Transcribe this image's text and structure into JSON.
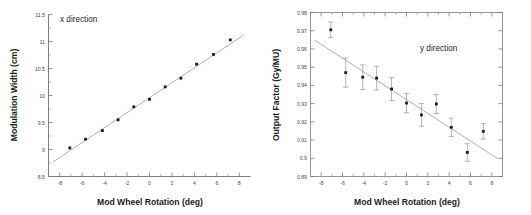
{
  "figure": {
    "panels": [
      "x direction panel",
      "y direction panel"
    ]
  },
  "chart_data": [
    {
      "type": "scatter",
      "panel_id": "x-direction",
      "title": "",
      "annotation": "x direction",
      "xlabel": "Mod Wheel Rotation (deg)",
      "ylabel": "Modulation Width (cm)",
      "xlim": [
        -9,
        9
      ],
      "ylim": [
        8.5,
        11.5
      ],
      "xticks": [
        -8,
        -6,
        -4,
        -2,
        0,
        2,
        4,
        6,
        8
      ],
      "xticklabels": [
        "-8",
        "-6",
        "-4",
        "-2",
        "0",
        "2",
        "4",
        "6",
        "8"
      ],
      "yticks": [
        8.5,
        9,
        9.5,
        10,
        10.5,
        11,
        11.5
      ],
      "yticklabels": [
        "8.5",
        "9",
        "9.5",
        "10",
        "10.5",
        "11",
        "11.5"
      ],
      "grid": false,
      "legend": null,
      "series": [
        {
          "name": "Modulation width measurements",
          "marker": "square",
          "x": [
            -7.1,
            -5.7,
            -4.2,
            -2.8,
            -1.4,
            0.0,
            1.4,
            2.8,
            4.2,
            5.7,
            7.2
          ],
          "y": [
            9.03,
            9.19,
            9.35,
            9.55,
            9.79,
            9.93,
            10.16,
            10.32,
            10.58,
            10.76,
            11.03
          ]
        },
        {
          "name": "linear fit",
          "type": "line",
          "x": [
            -8.6,
            8.4
          ],
          "y": [
            8.77,
            11.12
          ]
        }
      ]
    },
    {
      "type": "scatter",
      "panel_id": "y-direction",
      "title": "",
      "annotation": "y direction",
      "xlabel": "Mod Wheel Rotation (deg)",
      "ylabel": "Output Factor (Gy/MU)",
      "xlim": [
        -9,
        9
      ],
      "ylim": [
        0.89,
        0.98
      ],
      "xticks": [
        -8,
        -6,
        -4,
        -2,
        0,
        2,
        4,
        6,
        8
      ],
      "xticklabels": [
        "-8",
        "-6",
        "-4",
        "-2",
        "0",
        "2",
        "4",
        "6",
        "8"
      ],
      "yticks": [
        0.89,
        0.9,
        0.91,
        0.92,
        0.93,
        0.94,
        0.95,
        0.96,
        0.97,
        0.98
      ],
      "yticklabels": [
        "0.89",
        "0.9",
        "0.91",
        "0.92",
        "0.93",
        "0.94",
        "0.95",
        "0.96",
        "0.97",
        "0.98"
      ],
      "grid": false,
      "legend": null,
      "series": [
        {
          "name": "Output factor measurements",
          "marker": "square",
          "errorbars": true,
          "x": [
            -7.1,
            -5.7,
            -4.1,
            -2.8,
            -1.4,
            0.0,
            1.4,
            2.8,
            4.2,
            5.7,
            7.2
          ],
          "y": [
            0.9705,
            0.947,
            0.9445,
            0.944,
            0.938,
            0.9303,
            0.9238,
            0.9298,
            0.917,
            0.9032,
            0.9148
          ],
          "yerr": [
            0.0043,
            0.008,
            0.0068,
            0.0065,
            0.0063,
            0.0053,
            0.0062,
            0.0052,
            0.005,
            0.0048,
            0.0042
          ]
        },
        {
          "name": "linear fit",
          "type": "line",
          "x": [
            -8.6,
            8.6
          ],
          "y": [
            0.9648,
            0.8996
          ]
        }
      ]
    }
  ]
}
